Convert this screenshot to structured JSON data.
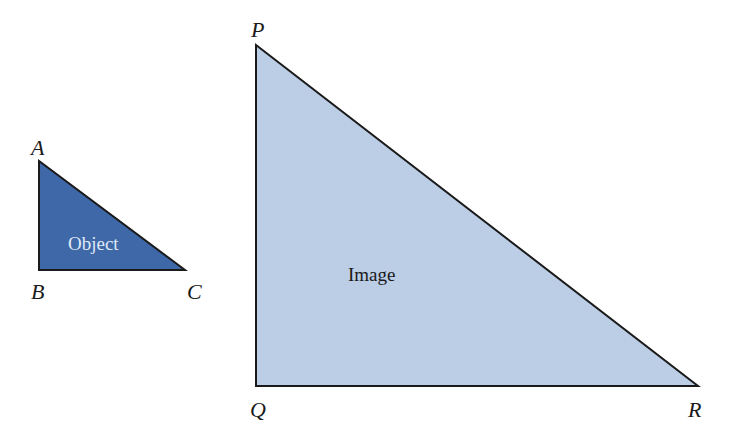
{
  "object_triangle": {
    "label": "Object",
    "fill": "#3f68a8",
    "text_color": "#dfe8f5",
    "vertices": {
      "top": "A",
      "bottom_left": "B",
      "bottom_right": "C"
    }
  },
  "image_triangle": {
    "label": "Image",
    "fill": "#bccde6",
    "text_color": "#1a1a1a",
    "vertices": {
      "top": "P",
      "bottom_left": "Q",
      "bottom_right": "R"
    }
  },
  "stroke_color": "#1a1a1a"
}
